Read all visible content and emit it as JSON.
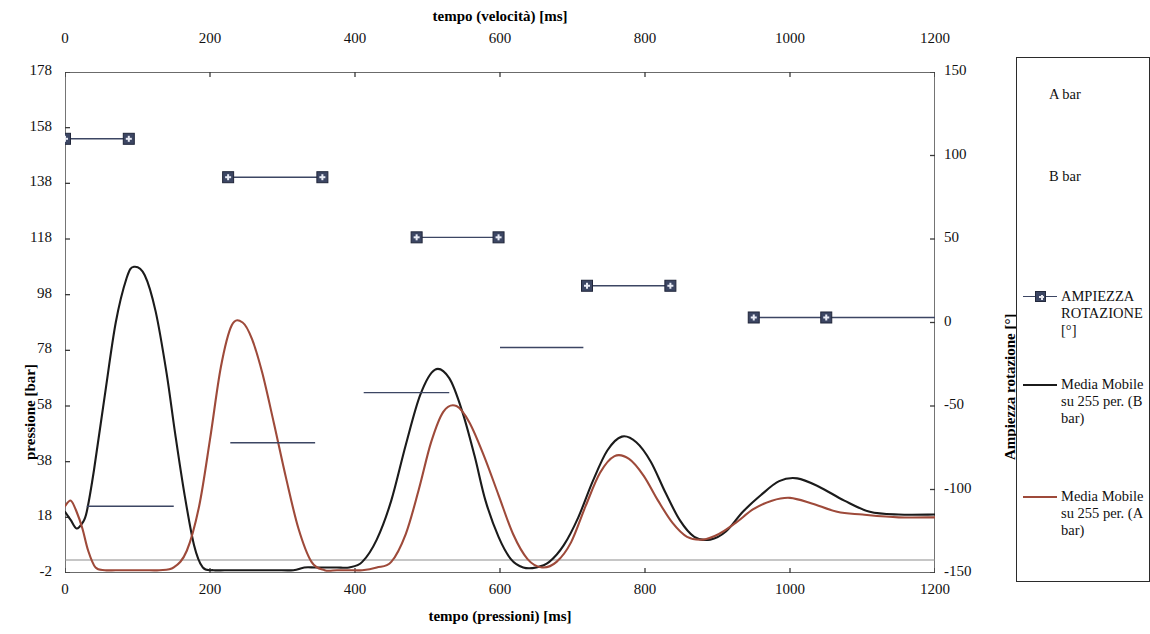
{
  "chart_data": {
    "type": "line",
    "title": "",
    "top_axis": {
      "label": "tempo (velocità) [ms]",
      "ticks": [
        0,
        200,
        400,
        600,
        800,
        1000,
        1200
      ],
      "range": [
        0,
        1200
      ]
    },
    "bottom_axis": {
      "label": "tempo (pressioni) [ms]",
      "ticks": [
        0,
        200,
        400,
        600,
        800,
        1000,
        1200
      ],
      "range": [
        0,
        1200
      ]
    },
    "left_axis": {
      "label": "pressione [bar]",
      "ticks": [
        178,
        158,
        138,
        118,
        98,
        78,
        58,
        38,
        18,
        -2
      ],
      "range": [
        -2,
        178
      ]
    },
    "right_axis": {
      "label": "Ampiezza rotazione [°]",
      "ticks": [
        150,
        100,
        50,
        0,
        -50,
        -100,
        -150
      ],
      "range": [
        -150,
        150
      ]
    },
    "grid": false,
    "legend_position": "right",
    "colors": {
      "series_b": "#1b1b1b",
      "series_a": "#9E4A3A",
      "markers": "#3c4663",
      "axis": "#3a3a3a"
    },
    "series": [
      {
        "name": "Media Mobile su 255 per. (B bar)",
        "axis": "left",
        "color": "#1b1b1b",
        "x": [
          0,
          8,
          16,
          24,
          30,
          40,
          55,
          70,
          85,
          95,
          110,
          125,
          140,
          152,
          165,
          178,
          190,
          205,
          220,
          240,
          265,
          290,
          315,
          330,
          345,
          360,
          375,
          392,
          410,
          430,
          450,
          470,
          490,
          510,
          530,
          548,
          565,
          580,
          598,
          615,
          632,
          650,
          668,
          688,
          708,
          728,
          748,
          768,
          788,
          808,
          828,
          848,
          868,
          890,
          912,
          935,
          960,
          985,
          1010,
          1040,
          1075,
          1110,
          1150,
          1200
        ],
        "y": [
          20,
          17,
          14,
          16,
          20,
          35,
          62,
          88,
          104,
          108,
          105,
          92,
          70,
          48,
          26,
          8,
          0,
          -1,
          -1,
          -1,
          -1,
          -1,
          -1,
          0,
          0,
          0,
          0,
          0,
          2,
          10,
          24,
          44,
          62,
          71,
          68,
          56,
          40,
          24,
          11,
          3,
          0,
          0,
          2,
          8,
          18,
          31,
          42,
          47,
          45,
          38,
          27,
          17,
          11,
          10,
          13,
          20,
          26,
          31,
          32,
          29,
          24,
          20,
          19,
          19
        ]
      },
      {
        "name": "Media Mobile su 255 per. (A bar)",
        "axis": "left",
        "color": "#9E4A3A",
        "x": [
          0,
          8,
          16,
          24,
          32,
          42,
          55,
          70,
          90,
          110,
          130,
          150,
          168,
          185,
          200,
          215,
          230,
          245,
          258,
          272,
          288,
          305,
          322,
          340,
          358,
          375,
          392,
          410,
          430,
          450,
          470,
          488,
          505,
          522,
          540,
          558,
          578,
          598,
          618,
          638,
          658,
          678,
          698,
          718,
          738,
          758,
          778,
          798,
          818,
          838,
          858,
          880,
          902,
          925,
          950,
          975,
          1000,
          1030,
          1065,
          1100,
          1150,
          1200
        ],
        "y": [
          22,
          24,
          20,
          14,
          6,
          0,
          -1,
          -1,
          -1,
          -1,
          -1,
          0,
          6,
          22,
          46,
          72,
          87,
          88,
          82,
          70,
          52,
          32,
          14,
          2,
          -1,
          -1,
          -1,
          -1,
          0,
          2,
          12,
          28,
          45,
          56,
          58,
          52,
          40,
          26,
          12,
          3,
          0,
          2,
          9,
          22,
          34,
          40,
          39,
          33,
          24,
          16,
          11,
          10,
          12,
          16,
          21,
          24,
          25,
          23,
          20,
          19,
          18,
          18
        ]
      },
      {
        "name": "AMPIEZZA ROTAZIONE [°]",
        "axis": "right",
        "color": "#3c4663",
        "marker": "square-plus",
        "segments": [
          {
            "x0": 0,
            "x1": 88,
            "value": 110,
            "markers": true
          },
          {
            "x0": 225,
            "x1": 355,
            "value": 87,
            "markers": true
          },
          {
            "x0": 485,
            "x1": 598,
            "value": 51,
            "markers": true
          },
          {
            "x0": 720,
            "x1": 835,
            "value": 22,
            "markers": true
          },
          {
            "x0": 950,
            "x1": 1200,
            "value": 3,
            "markers": true,
            "marker_x": [
              950,
              1050
            ]
          },
          {
            "x0": 600,
            "x1": 715,
            "value": -15,
            "markers": false
          },
          {
            "x0": 412,
            "x1": 530,
            "value": -42,
            "markers": false
          },
          {
            "x0": 228,
            "x1": 345,
            "value": -72,
            "markers": false
          },
          {
            "x0": 30,
            "x1": 150,
            "value": -110,
            "markers": false
          }
        ]
      }
    ],
    "legend_entries": [
      {
        "label": "A bar",
        "icon": "none"
      },
      {
        "label": "B bar",
        "icon": "none"
      },
      {
        "label": "AMPIEZZA ROTAZIONE [°]",
        "icon": "marker-line",
        "color": "#3c4663"
      },
      {
        "label": "Media Mobile su 255 per. (B bar)",
        "icon": "line",
        "color": "#1b1b1b"
      },
      {
        "label": "Media Mobile su 255 per. (A bar)",
        "icon": "line",
        "color": "#9E4A3A"
      }
    ]
  }
}
